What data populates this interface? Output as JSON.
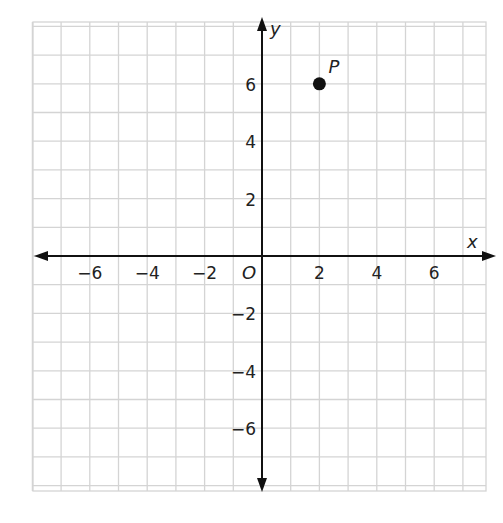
{
  "chart_data": {
    "type": "scatter",
    "title": "",
    "xlabel": "x",
    "ylabel": "y",
    "origin_label": "O",
    "xlim": [
      -8,
      8
    ],
    "ylim": [
      -8,
      8
    ],
    "grid": true,
    "grid_step": 1,
    "x_ticks": [
      -6,
      -4,
      -2,
      2,
      4,
      6
    ],
    "y_ticks": [
      6,
      4,
      2,
      -2,
      -4,
      -6
    ],
    "x_tick_labels": [
      "−6",
      "−4",
      "−2",
      "2",
      "4",
      "6"
    ],
    "y_tick_labels": [
      "6",
      "4",
      "2",
      "−2",
      "−4",
      "−6"
    ],
    "points": [
      {
        "label": "P",
        "x": 2,
        "y": 6
      }
    ],
    "colors": {
      "grid": "#d4d4d4",
      "axis": "#111111",
      "point": "#111111"
    }
  }
}
